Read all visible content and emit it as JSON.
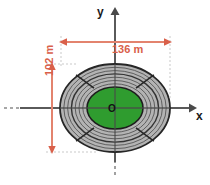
{
  "figure": {
    "title": "",
    "axes": {
      "x_label": "x",
      "y_label": "y",
      "origin_label": "O"
    },
    "dimensions": [
      {
        "name": "width",
        "label": "136 m",
        "value": 136,
        "unit": "m",
        "orientation": "horizontal",
        "color": "#d9604a"
      },
      {
        "name": "height",
        "label": "102 m",
        "value": 102,
        "unit": "m",
        "orientation": "vertical",
        "color": "#d9604a"
      }
    ],
    "shape": {
      "kind": "concentric-ellipses",
      "description": "stadium-track",
      "field_color": "#2f9c2f",
      "track_color": "#b3b3b3",
      "track_line_color": "#2a2a2a",
      "lane_count": 7,
      "center_x": 115,
      "center_y": 108,
      "outer_rx": 55,
      "outer_ry": 44,
      "inner_rx": 28,
      "inner_ry": 21
    },
    "axis_color": "#5a5a5a"
  }
}
